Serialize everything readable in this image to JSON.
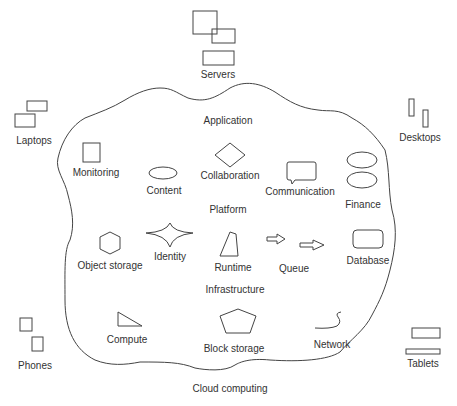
{
  "diagram": {
    "cloud_label": "Cloud computing",
    "layers": {
      "application": "Application",
      "platform": "Platform",
      "infrastructure": "Infrastructure"
    },
    "clients": {
      "servers": "Servers",
      "laptops": "Laptops",
      "desktops": "Desktops",
      "phones": "Phones",
      "tablets": "Tablets"
    },
    "application_items": {
      "monitoring": "Monitoring",
      "content": "Content",
      "collaboration": "Collaboration",
      "communication": "Communication",
      "finance": "Finance"
    },
    "platform_items": {
      "object_storage": "Object storage",
      "identity": "Identity",
      "runtime": "Runtime",
      "queue": "Queue",
      "database": "Database"
    },
    "infrastructure_items": {
      "compute": "Compute",
      "block_storage": "Block storage",
      "network": "Network"
    },
    "colors": {
      "stroke": "#444444",
      "text": "#333333",
      "background": "#ffffff"
    }
  }
}
